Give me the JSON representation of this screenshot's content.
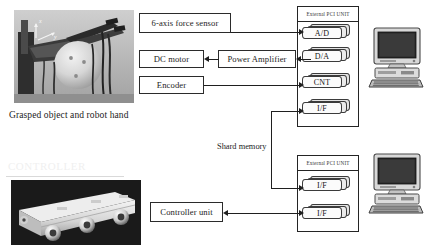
{
  "figure": {
    "captions": [
      {
        "text": "Grasped object and robot hand"
      }
    ],
    "notes": [
      {
        "text": "Shard memory"
      }
    ]
  },
  "photos": [
    {
      "name": "robot-hand-photo",
      "alt": "Grasped object and robot hand"
    },
    {
      "name": "controller-unit-photo",
      "alt": "Controller unit hardware"
    }
  ],
  "blocks": {
    "force_sensor": "6-axis force sensor",
    "dc_motor": "DC motor",
    "power_amplifier": "Power Amplifier",
    "encoder": "Encoder",
    "controller_unit": "Controller unit"
  },
  "pci_units": [
    {
      "name": "external-pci-unit-top",
      "title": "External PCI UNIT",
      "cards": [
        {
          "label": "A/D"
        },
        {
          "label": "D/A"
        },
        {
          "label": "CNT"
        },
        {
          "label": "I/F"
        }
      ]
    },
    {
      "name": "external-pci-unit-bottom",
      "title": "External PCI UNIT",
      "cards": [
        {
          "label": "I/F"
        },
        {
          "label": "I/F"
        }
      ]
    }
  ],
  "computers": [
    {
      "name": "host-computer-top",
      "alt": "Desktop computer with CRT monitor and keyboard"
    },
    {
      "name": "host-computer-bottom",
      "alt": "Desktop computer with CRT monitor and keyboard"
    }
  ],
  "colors": {
    "line": "#1f1f1f",
    "box_border": "#2b2b2b",
    "text": "#1d1d1d",
    "card_face": "#fbfbfb",
    "background": "#ffffff"
  }
}
